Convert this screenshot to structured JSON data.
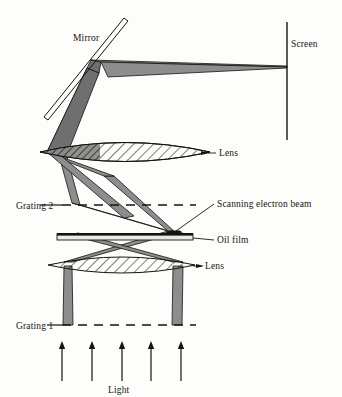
{
  "figure": {
    "type": "optical-schematic",
    "title_visible": false,
    "background_color": "#fdfdfb",
    "ink_color": "#17140f",
    "beam_fill": "#8d8d8d",
    "beam_fill_dark": "#6f6f6f"
  },
  "labels": {
    "mirror": "Mirror",
    "screen": "Screen",
    "lens_upper": "Lens",
    "lens_lower": "Lens",
    "grating2": "Grating 2",
    "grating1": "Grating 1",
    "scanning_electron_beam": "Scanning electron beam",
    "oil_film": "Oil film",
    "light": "Light"
  },
  "components": [
    {
      "name": "mirror",
      "kind": "flat-mirror",
      "label": "Mirror",
      "x1": 44,
      "y1": 117,
      "x2": 124,
      "y2": 18,
      "thickness": 4,
      "angle_deg": 51
    },
    {
      "name": "screen",
      "kind": "vertical-line",
      "label": "Screen",
      "x": 287,
      "y_top": 22,
      "y_bottom": 140,
      "beam_hit_y": 67
    },
    {
      "name": "lens-upper",
      "kind": "biconvex-lens-hatched",
      "label": "Lens",
      "x_left": 40,
      "x_right": 210,
      "center_y": 152,
      "half_height": 13
    },
    {
      "name": "lens-lower",
      "kind": "biconvex-lens-hatched",
      "label": "Lens",
      "x_left": 48,
      "x_right": 195,
      "center_y": 265,
      "half_height": 11
    },
    {
      "name": "oil-film",
      "kind": "horizontal-bar",
      "label": "Oil film",
      "x_left": 57,
      "x_right": 193,
      "y": 234,
      "height": 6,
      "bump_x": 172
    },
    {
      "name": "grating-2",
      "kind": "dashed-line",
      "label": "Grating 2",
      "x_left": 62,
      "x_right": 196,
      "y": 205
    },
    {
      "name": "grating-1",
      "kind": "dashed-line",
      "label": "Grating 1",
      "x_left": 62,
      "x_right": 196,
      "y": 325
    },
    {
      "name": "scanning-electron-beam",
      "kind": "leader-annotation",
      "label": "Scanning electron beam",
      "target_x": 172,
      "target_y": 232,
      "leader_to_x": 214,
      "leader_to_y": 204
    }
  ],
  "light_arrows": {
    "label": "Light",
    "count": 5,
    "x_positions": [
      62,
      92,
      122,
      151,
      181
    ],
    "y_tail": 381,
    "y_head": 343
  },
  "label_positions": {
    "mirror": {
      "x": 73,
      "y": 41
    },
    "screen": {
      "x": 291,
      "y": 47
    },
    "lens_upper": {
      "x": 219,
      "y": 155
    },
    "lens_lower": {
      "x": 205,
      "y": 268
    },
    "grating2": {
      "x": 18,
      "y": 209
    },
    "grating1": {
      "x": 18,
      "y": 329
    },
    "scanning_electron_beam": {
      "x": 217,
      "y": 208
    },
    "oil_film": {
      "x": 217,
      "y": 240
    },
    "light": {
      "x": 108,
      "y": 393
    }
  }
}
